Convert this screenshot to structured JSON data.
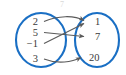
{
  "figure": {
    "type": "mapping-diagram",
    "title": "",
    "top_artifact": "7",
    "colors": {
      "oval_stroke": "#1a6fc4",
      "arrow_stroke": "#5a5a5a",
      "number_text": "#3a3a3a",
      "background": "#ffffff"
    },
    "domain_set": {
      "label": "",
      "elements": [
        {
          "value": "2",
          "x": 36,
          "y": 22
        },
        {
          "value": "5",
          "x": 36,
          "y": 33
        },
        {
          "value": "−1",
          "x": 36,
          "y": 44
        },
        {
          "value": "3",
          "x": 36,
          "y": 59
        }
      ]
    },
    "codomain_set": {
      "label": "",
      "elements": [
        {
          "value": "1",
          "x": 98,
          "y": 22
        },
        {
          "value": "7",
          "x": 98,
          "y": 37
        },
        {
          "value": "20",
          "x": 94,
          "y": 58
        }
      ]
    },
    "mappings": [
      {
        "from": "2",
        "to": "1",
        "curve": "arc-up"
      },
      {
        "from": "5",
        "to": "7",
        "curve": "straight"
      },
      {
        "from": "−1",
        "to": "1",
        "curve": "straight"
      },
      {
        "from": "3",
        "to": "20",
        "curve": "arc-up"
      }
    ]
  }
}
